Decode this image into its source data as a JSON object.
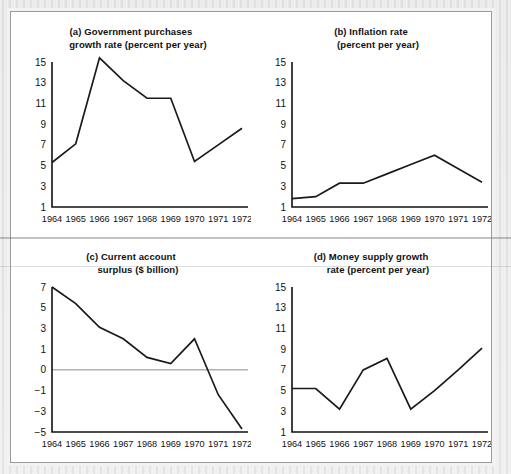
{
  "figure": {
    "caption_years_range": "1964-1972",
    "panel_count": 4
  },
  "chart_data": [
    {
      "id": "a",
      "type": "line",
      "title": "(a) Government purchases growth rate (percent per year)",
      "title_line1": "(a) Government purchases",
      "title_line2": "growth rate (percent per year)",
      "xlabel": "",
      "ylabel": "",
      "x": [
        "1964",
        "1965",
        "1966",
        "1967",
        "1968",
        "1969",
        "1970",
        "1971",
        "1972"
      ],
      "categories": [
        "1964",
        "1965",
        "1966",
        "1967",
        "1968",
        "1969",
        "1970",
        "1971",
        "1972"
      ],
      "values": [
        5.3,
        7.1,
        15.4,
        13.2,
        11.5,
        11.5,
        5.4,
        7.0,
        8.6
      ],
      "yticks": [
        15,
        13,
        11,
        9,
        7,
        5,
        3,
        1
      ],
      "ytick_labels": [
        "15",
        "13",
        "11",
        "9",
        "7",
        "5",
        "3",
        "1"
      ],
      "ylim": [
        1,
        16
      ],
      "grid": false,
      "legend": "none"
    },
    {
      "id": "b",
      "type": "line",
      "title": "(b) Inflation rate (percent per year)",
      "title_line1": "(b) Inflation rate",
      "title_line2": "(percent per year)",
      "xlabel": "",
      "ylabel": "",
      "x": [
        "1964",
        "1965",
        "1966",
        "1967",
        "1968",
        "1969",
        "1970",
        "1971",
        "1972"
      ],
      "categories": [
        "1964",
        "1965",
        "1966",
        "1967",
        "1968",
        "1969",
        "1970",
        "1971",
        "1972"
      ],
      "values": [
        1.8,
        2.0,
        3.3,
        3.3,
        4.2,
        5.1,
        6.0,
        4.7,
        3.4
      ],
      "yticks": [
        15,
        13,
        11,
        9,
        7,
        5,
        3,
        1
      ],
      "ytick_labels": [
        "15",
        "13",
        "11",
        "9",
        "7",
        "5",
        "3",
        "1"
      ],
      "ylim": [
        1,
        16
      ],
      "grid": false,
      "legend": "none"
    },
    {
      "id": "c",
      "type": "line",
      "title": "(c) Current account surplus ($ billion)",
      "title_line1": "(c) Current account",
      "title_line2": "surplus ($ billion)",
      "xlabel": "",
      "ylabel": "",
      "x": [
        "1964",
        "1965",
        "1966",
        "1967",
        "1968",
        "1969",
        "1970",
        "1971",
        "1972"
      ],
      "categories": [
        "1964",
        "1965",
        "1966",
        "1967",
        "1968",
        "1969",
        "1970",
        "1971",
        "1972"
      ],
      "values": [
        7.0,
        5.4,
        3.1,
        2.0,
        0.6,
        0.3,
        2.0,
        -1.4,
        -4.7
      ],
      "yticks": [
        7,
        5,
        3,
        1,
        0,
        -1,
        -3,
        -5
      ],
      "ytick_labels": [
        "7",
        "5",
        "3",
        "1",
        "0",
        "−1",
        "−3",
        "−5"
      ],
      "ylim": [
        -5,
        7
      ],
      "zero_line": 0,
      "grid": false,
      "legend": "none"
    },
    {
      "id": "d",
      "type": "line",
      "title": "(d) Money supply growth rate (percent per year)",
      "title_line1": "(d) Money supply growth",
      "title_line2": "rate (percent per year)",
      "xlabel": "",
      "ylabel": "",
      "x": [
        "1964",
        "1965",
        "1966",
        "1967",
        "1968",
        "1969",
        "1970",
        "1971",
        "1972"
      ],
      "categories": [
        "1964",
        "1965",
        "1966",
        "1967",
        "1968",
        "1969",
        "1970",
        "1971",
        "1972"
      ],
      "values": [
        5.2,
        5.2,
        3.2,
        7.0,
        8.1,
        3.2,
        5.0,
        7.0,
        9.1
      ],
      "yticks": [
        15,
        13,
        11,
        9,
        7,
        5,
        3,
        1
      ],
      "ytick_labels": [
        "15",
        "13",
        "11",
        "9",
        "7",
        "5",
        "3",
        "1"
      ],
      "ylim": [
        1,
        16
      ],
      "grid": false,
      "legend": "none"
    }
  ],
  "colors": {
    "line": "#1a1a1a",
    "axis": "#111111",
    "zero_line": "#8a8a8a",
    "plate_background": "#ffffff",
    "page_background": "#e9e9e9",
    "plate_border": "#9b9b9b"
  }
}
